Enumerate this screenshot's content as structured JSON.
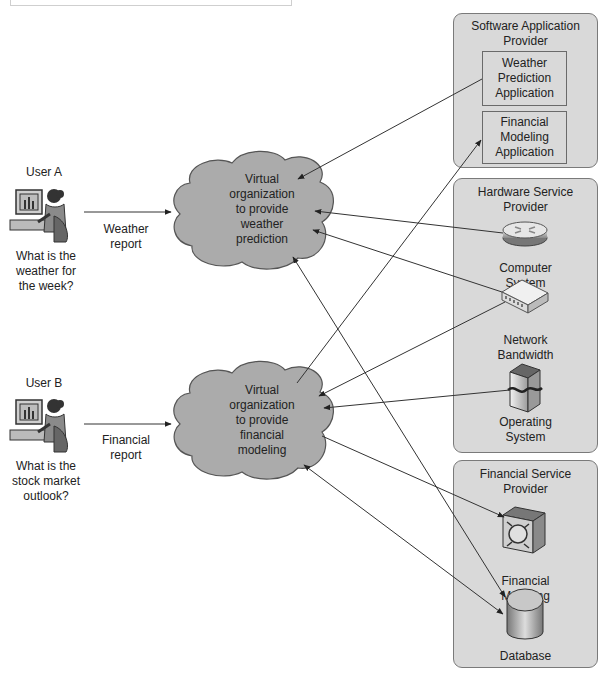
{
  "users": [
    {
      "label": "User A",
      "question": [
        "What is the",
        "weather for",
        "the week?"
      ],
      "report": [
        "Weather",
        "report"
      ]
    },
    {
      "label": "User B",
      "question": [
        "What is the",
        "stock market",
        "outlook?"
      ],
      "report": [
        "Financial",
        "report"
      ]
    }
  ],
  "clouds": [
    {
      "lines": [
        "Virtual",
        "organization",
        "to provide",
        "weather",
        "prediction"
      ]
    },
    {
      "lines": [
        "Virtual",
        "organization",
        "to provide",
        "financial",
        "modeling"
      ]
    }
  ],
  "providers": {
    "software": {
      "title": [
        "Software Application",
        "Provider"
      ],
      "apps": [
        {
          "lines": [
            "Weather",
            "Prediction",
            "Application"
          ]
        },
        {
          "lines": [
            "Financial",
            "Modeling",
            "Application"
          ]
        }
      ]
    },
    "hardware": {
      "title": [
        "Hardware Service",
        "Provider"
      ],
      "items": [
        {
          "icon": "router-icon",
          "lines": [
            "Computer",
            "System"
          ]
        },
        {
          "icon": "network-switch-icon",
          "lines": [
            "Network",
            "Bandwidth"
          ]
        },
        {
          "icon": "server-tower-icon",
          "lines": [
            "Operating",
            "System"
          ]
        }
      ]
    },
    "financial": {
      "title": [
        "Financial Service",
        "Provider"
      ],
      "items": [
        {
          "icon": "processor-chip-icon",
          "lines": [
            "Financial",
            "Modeling"
          ]
        },
        {
          "icon": "database-cylinder-icon",
          "lines": [
            "Database"
          ]
        }
      ]
    }
  },
  "colors": {
    "box_fill": "#d9d9d9",
    "box_border": "#7a7a7a",
    "cloud_fill": "#a9a9a9",
    "arrow": "#333333"
  }
}
